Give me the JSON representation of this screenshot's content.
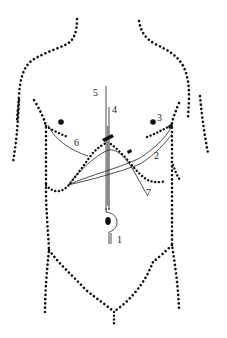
{
  "diagram": {
    "type": "anatomical-torso-schematic",
    "view": "anterior",
    "colors": {
      "outline": "#111111",
      "lines": "#222222",
      "tube_fill": "#888888",
      "background": "#ffffff"
    },
    "labels": [
      {
        "id": "1",
        "text": "1",
        "x": 117,
        "y": 243
      },
      {
        "id": "2",
        "text": "2",
        "x": 154,
        "y": 159
      },
      {
        "id": "3",
        "text": "3",
        "x": 157,
        "y": 121
      },
      {
        "id": "4",
        "text": "4",
        "x": 113,
        "y": 113
      },
      {
        "id": "5",
        "text": "5",
        "x": 92,
        "y": 95
      },
      {
        "id": "6",
        "text": "6",
        "x": 73,
        "y": 147
      },
      {
        "id": "7",
        "text": "7",
        "x": 146,
        "y": 197
      }
    ]
  }
}
